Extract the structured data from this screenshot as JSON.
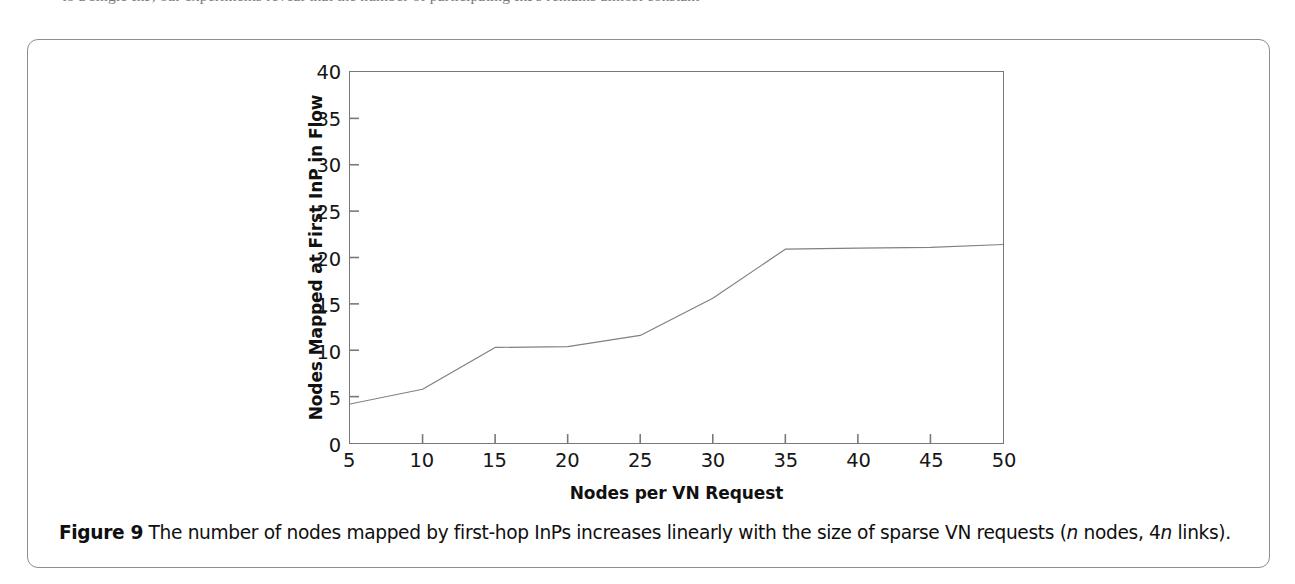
{
  "page": {
    "top_cut_text": "to a single InP, our experiments reveal that the number of participating InPs remains almost constant",
    "background_color": "#ffffff",
    "frame_color": "#8d8d8d"
  },
  "caption": {
    "label": "Figure 9",
    "text_part1": "The number of nodes mapped by first-hop InPs increases linearly with the size of sparse VN requests (",
    "italic1": "n",
    "text_part2": " nodes, 4",
    "italic2": "n",
    "text_part3": " links)."
  },
  "chart_data": {
    "type": "line",
    "title": "",
    "xlabel": "Nodes per VN Request",
    "ylabel": "Nodes Mapped at First InP in Flow",
    "xlim": [
      5,
      50
    ],
    "ylim": [
      0,
      40
    ],
    "xticks": [
      "5",
      "10",
      "15",
      "20",
      "25",
      "30",
      "35",
      "40",
      "45",
      "50"
    ],
    "yticks": [
      "0",
      "5",
      "10",
      "15",
      "20",
      "25",
      "30",
      "35",
      "40"
    ],
    "grid": false,
    "legend": "none",
    "line_color": "#808080",
    "line_width": 1.2,
    "series": [
      {
        "name": "Nodes mapped at first InP",
        "x": [
          5,
          10,
          15,
          20,
          25,
          30,
          35,
          40,
          45,
          50
        ],
        "values": [
          4.2,
          5.8,
          10.3,
          10.4,
          11.6,
          15.6,
          20.9,
          21.0,
          21.1,
          21.4
        ]
      }
    ]
  }
}
